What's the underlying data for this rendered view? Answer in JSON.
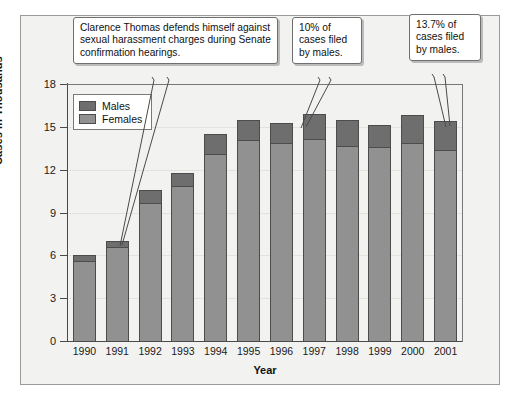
{
  "chart_data": {
    "type": "bar",
    "subtype": "stacked-bar",
    "title": "",
    "xlabel": "Year",
    "ylabel": "Cases in Thousands",
    "ylim": [
      0,
      18
    ],
    "yticks": [
      0,
      3,
      6,
      9,
      12,
      15,
      18
    ],
    "ytick_labels": [
      "0",
      "3",
      "6",
      "9",
      "12",
      "15",
      "18"
    ],
    "grid": true,
    "legend_position": "upper-left-inside",
    "categories": [
      "1990",
      "1991",
      "1992",
      "1993",
      "1994",
      "1995",
      "1996",
      "1997",
      "1998",
      "1999",
      "2000",
      "2001"
    ],
    "series": [
      {
        "name": "Females",
        "color": "#919191",
        "values": [
          5.5,
          6.5,
          9.6,
          10.8,
          13.0,
          14.0,
          13.8,
          14.1,
          13.6,
          13.5,
          13.8,
          13.3
        ]
      },
      {
        "name": "Males",
        "color": "#6e6e6e",
        "values": [
          0.5,
          0.5,
          1.0,
          1.0,
          1.5,
          1.5,
          1.5,
          1.8,
          1.9,
          1.6,
          2.0,
          2.1
        ]
      }
    ],
    "totals": [
      6.0,
      7.0,
      10.6,
      11.8,
      14.5,
      15.5,
      15.3,
      15.9,
      15.5,
      15.1,
      15.8,
      15.4
    ],
    "annotations": [
      {
        "id": "callout-thomas",
        "text": "Clarence Thomas defends himself against sexual harassment charges during Senate confirmation hearings.",
        "points_to": "1991"
      },
      {
        "id": "callout-1996",
        "text": "10% of cases filed by males.",
        "points_to": "1996"
      },
      {
        "id": "callout-2001",
        "text": "13.7% of cases filed by males.",
        "points_to": "2001"
      }
    ]
  },
  "legend": {
    "items": [
      {
        "label": "Males"
      },
      {
        "label": "Females"
      }
    ]
  },
  "axes": {
    "y_title": "Cases in Thousands",
    "x_title": "Year"
  },
  "colors": {
    "male_fill": "#6e6e6e",
    "female_fill": "#919191",
    "bar_outline": "#4c4c4c",
    "panel_background": "#f2f2f0",
    "frame_border": "#9a9a9a",
    "gridline": "#e2e2df",
    "axis_line": "#4a4a4a"
  }
}
